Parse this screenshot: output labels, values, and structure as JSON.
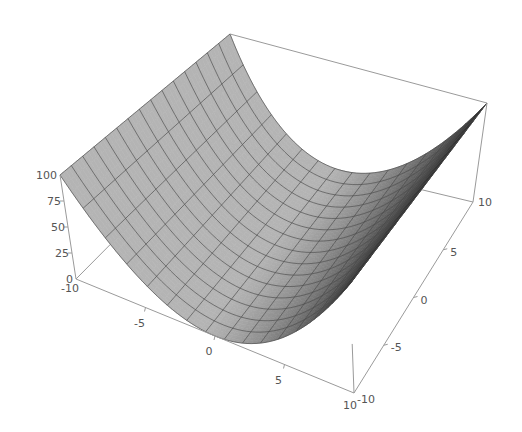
{
  "chart_data": {
    "type": "surface3d",
    "title": "",
    "function": "z = x^2",
    "x_range": [
      -10,
      10
    ],
    "y_range": [
      -10,
      10
    ],
    "z_range": [
      0,
      100
    ],
    "mesh_divisions": 15,
    "x_ticks": [
      {
        "value": -10,
        "label": "-10"
      },
      {
        "value": -5,
        "label": "-5"
      },
      {
        "value": 0,
        "label": "0"
      },
      {
        "value": 5,
        "label": "5"
      },
      {
        "value": 10,
        "label": "10"
      }
    ],
    "y_ticks": [
      {
        "value": -10,
        "label": "-10"
      },
      {
        "value": -5,
        "label": "-5"
      },
      {
        "value": 0,
        "label": "0"
      },
      {
        "value": 5,
        "label": "5"
      },
      {
        "value": 10,
        "label": "10"
      }
    ],
    "z_ticks": [
      {
        "value": 0,
        "label": "0"
      },
      {
        "value": 25,
        "label": "25"
      },
      {
        "value": 50,
        "label": "50"
      },
      {
        "value": 75,
        "label": "75"
      },
      {
        "value": 100,
        "label": "100"
      }
    ],
    "box": true,
    "axes_labels": {
      "x": "",
      "y": "",
      "z": ""
    },
    "colors": {
      "surface_light": "#b4b4b4",
      "surface_dark": "#2e2e2e",
      "mesh": "#4a4a4a",
      "box": "#9a9a9a",
      "tick_text": "#555555",
      "background": "#ffffff"
    }
  }
}
